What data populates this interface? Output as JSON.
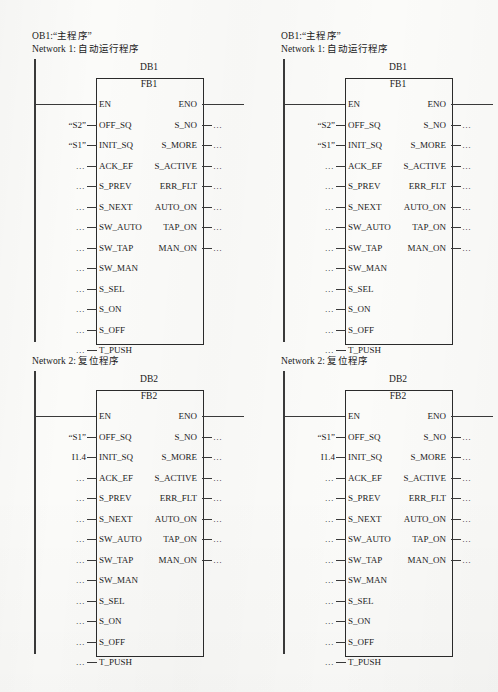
{
  "document": {
    "type": "ladder-logic-diagram",
    "software": "STEP 7 LAD"
  },
  "columns": [
    {
      "id": "left"
    },
    {
      "id": "right"
    }
  ],
  "networks": [
    {
      "id": "network-1",
      "ob_title": "OB1:“主程序”",
      "network_title": "Network 1: 自动运行程序",
      "db_label": "DB1",
      "fb_label": "FB1",
      "inputs": [
        {
          "pin": "EN",
          "operand": "",
          "kind": "rail"
        },
        {
          "pin": "OFF_SQ",
          "operand": "“S2”",
          "kind": "operand"
        },
        {
          "pin": "INIT_SQ",
          "operand": "“S1”",
          "kind": "operand"
        },
        {
          "pin": "ACK_EF",
          "operand": "…",
          "kind": "dots"
        },
        {
          "pin": "S_PREV",
          "operand": "…",
          "kind": "dots"
        },
        {
          "pin": "S_NEXT",
          "operand": "…",
          "kind": "dots"
        },
        {
          "pin": "SW_AUTO",
          "operand": "…",
          "kind": "dots"
        },
        {
          "pin": "SW_TAP",
          "operand": "…",
          "kind": "dots"
        },
        {
          "pin": "SW_MAN",
          "operand": "…",
          "kind": "dots"
        },
        {
          "pin": "S_SEL",
          "operand": "…",
          "kind": "dots"
        },
        {
          "pin": "S_ON",
          "operand": "…",
          "kind": "dots"
        },
        {
          "pin": "S_OFF",
          "operand": "…",
          "kind": "dots"
        },
        {
          "pin": "T_PUSH",
          "operand": "…",
          "kind": "dots"
        }
      ],
      "outputs": [
        {
          "pin": "ENO",
          "operand": "",
          "kind": "wire"
        },
        {
          "pin": "S_NO",
          "operand": "…",
          "kind": "dots"
        },
        {
          "pin": "S_MORE",
          "operand": "…",
          "kind": "dots"
        },
        {
          "pin": "S_ACTIVE",
          "operand": "…",
          "kind": "dots"
        },
        {
          "pin": "ERR_FLT",
          "operand": "…",
          "kind": "dots"
        },
        {
          "pin": "AUTO_ON",
          "operand": "…",
          "kind": "dots"
        },
        {
          "pin": "TAP_ON",
          "operand": "…",
          "kind": "dots"
        },
        {
          "pin": "MAN_ON",
          "operand": "…",
          "kind": "dots"
        }
      ]
    },
    {
      "id": "network-2",
      "ob_title": "",
      "network_title": "Network 2: 复位程序",
      "db_label": "DB2",
      "fb_label": "FB2",
      "inputs": [
        {
          "pin": "EN",
          "operand": "",
          "kind": "rail"
        },
        {
          "pin": "OFF_SQ",
          "operand": "“S1”",
          "kind": "operand"
        },
        {
          "pin": "INIT_SQ",
          "operand": "I1.4",
          "kind": "operand"
        },
        {
          "pin": "ACK_EF",
          "operand": "…",
          "kind": "dots"
        },
        {
          "pin": "S_PREV",
          "operand": "…",
          "kind": "dots"
        },
        {
          "pin": "S_NEXT",
          "operand": "…",
          "kind": "dots"
        },
        {
          "pin": "SW_AUTO",
          "operand": "…",
          "kind": "dots"
        },
        {
          "pin": "SW_TAP",
          "operand": "…",
          "kind": "dots"
        },
        {
          "pin": "SW_MAN",
          "operand": "…",
          "kind": "dots"
        },
        {
          "pin": "S_SEL",
          "operand": "…",
          "kind": "dots"
        },
        {
          "pin": "S_ON",
          "operand": "…",
          "kind": "dots"
        },
        {
          "pin": "S_OFF",
          "operand": "…",
          "kind": "dots"
        },
        {
          "pin": "T_PUSH",
          "operand": "…",
          "kind": "dots"
        }
      ],
      "outputs": [
        {
          "pin": "ENO",
          "operand": "",
          "kind": "wire"
        },
        {
          "pin": "S_NO",
          "operand": "…",
          "kind": "dots"
        },
        {
          "pin": "S_MORE",
          "operand": "…",
          "kind": "dots"
        },
        {
          "pin": "S_ACTIVE",
          "operand": "…",
          "kind": "dots"
        },
        {
          "pin": "ERR_FLT",
          "operand": "…",
          "kind": "dots"
        },
        {
          "pin": "AUTO_ON",
          "operand": "…",
          "kind": "dots"
        },
        {
          "pin": "TAP_ON",
          "operand": "…",
          "kind": "dots"
        },
        {
          "pin": "MAN_ON",
          "operand": "…",
          "kind": "dots"
        }
      ]
    }
  ],
  "colors": {
    "ink": "#2b2b2b",
    "paper": "#fbfbf9",
    "wire": "#3a3a3a"
  }
}
